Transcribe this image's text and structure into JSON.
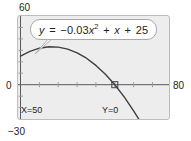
{
  "graph": {
    "equation_plain": "y = -0.03x^2 + x + 25",
    "equation_parts": {
      "lhs": "y",
      "equals": "=",
      "coefficient": "−0.03",
      "variable": "x",
      "exponent": "2",
      "plus1": "+",
      "linear_term": "x",
      "plus2": "+",
      "constant": "25"
    },
    "axis_labels": {
      "top": "60",
      "bottom": "−30",
      "left": "0",
      "right": "80"
    },
    "readouts": {
      "x_readout": "X=50",
      "y_readout": "Y=0"
    },
    "colors": {
      "screen_background": "#ededee",
      "screen_border": "#bcbdc0",
      "curve": "#3f3f40",
      "axis": "#58595b",
      "tick": "#9a9b9e",
      "text": "#231f20",
      "callout_fill": "#ffffff",
      "callout_border": "#a7a9ac"
    }
  },
  "chart_data": {
    "type": "line",
    "title": "",
    "xlabel": "",
    "ylabel": "",
    "equation": "y = -0.03x^2 + x + 25",
    "coefficients": {
      "a": -0.03,
      "b": 1,
      "c": 25
    },
    "xlim": [
      0,
      80
    ],
    "ylim": [
      -30,
      60
    ],
    "xticks": [
      10,
      20,
      30,
      40,
      50,
      60,
      70
    ],
    "yticks": [
      -20,
      -10,
      10,
      20,
      30,
      40,
      50
    ],
    "grid": false,
    "legend": false,
    "trace_point": {
      "x": 50,
      "y": 0,
      "label_x": "X=50",
      "label_y": "Y=0"
    },
    "vertex": {
      "x": 16.67,
      "y": 33.33
    },
    "y_intercept": 25,
    "x_intercepts": [
      -16.67,
      50
    ],
    "series": [
      {
        "name": "y = -0.03x^2 + x + 25",
        "x": [
          0,
          5,
          10,
          15,
          20,
          25,
          30,
          35,
          40,
          45,
          50,
          55,
          60,
          65,
          70,
          75,
          80
        ],
        "values": [
          25,
          29.25,
          32,
          33.25,
          33,
          31.25,
          28,
          23.25,
          17,
          9.25,
          0,
          -10.75,
          -23,
          -36.75,
          -52,
          -68.75,
          -87
        ]
      }
    ]
  }
}
